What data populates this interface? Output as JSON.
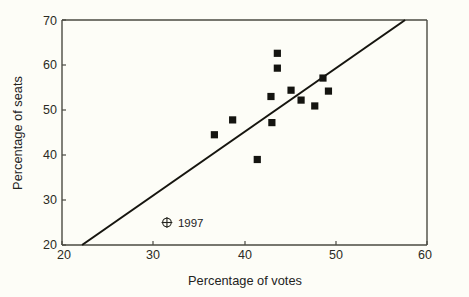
{
  "chart_data": {
    "type": "scatter",
    "title": "",
    "xlabel": "Percentage of votes",
    "ylabel": "Percentage of seats",
    "xlim": [
      20,
      60
    ],
    "ylim": [
      20,
      70
    ],
    "xticks": [
      20,
      30,
      40,
      50,
      60
    ],
    "yticks": [
      20,
      30,
      40,
      50,
      60,
      70
    ],
    "xtick_labels": [
      "20",
      "30",
      "40",
      "50",
      "60"
    ],
    "ytick_labels": [
      "20",
      "30",
      "40",
      "50",
      "60",
      "70"
    ],
    "grid": false,
    "legend_position": "none",
    "marker_style": "filled-square",
    "points": [
      {
        "x": 36.7,
        "y": 44.5
      },
      {
        "x": 38.7,
        "y": 47.8
      },
      {
        "x": 41.4,
        "y": 39.0
      },
      {
        "x": 42.9,
        "y": 53.0
      },
      {
        "x": 43.0,
        "y": 47.2
      },
      {
        "x": 43.6,
        "y": 62.6
      },
      {
        "x": 43.6,
        "y": 59.3
      },
      {
        "x": 45.1,
        "y": 54.4
      },
      {
        "x": 46.2,
        "y": 52.2
      },
      {
        "x": 47.7,
        "y": 50.9
      },
      {
        "x": 48.6,
        "y": 57.1
      },
      {
        "x": 49.2,
        "y": 54.2
      }
    ],
    "trend_line": {
      "x0": 22.2,
      "y0": 20.0,
      "x1": 57.6,
      "y1": 70.0,
      "label": "fitted regression line"
    },
    "annotations": [
      {
        "name": "1997",
        "label": "1997",
        "marker": "circle-plus",
        "x": 31.5,
        "y": 25.0
      }
    ],
    "colors": {
      "background": "#fdfdf7",
      "axis": "#4a4a42",
      "marker": "#141410",
      "line": "#16150f",
      "text": "#23231d"
    }
  }
}
